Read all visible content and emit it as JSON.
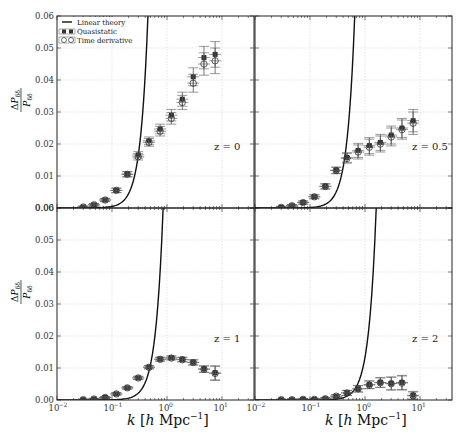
{
  "chart_data": {
    "type": "scatter",
    "layout": "2x2 panels, shared axes",
    "xlabel": "k [h Mpc^-1]",
    "ylabel": "ΔP_δδ / P_δδ",
    "xscale": "log",
    "xlim": [
      0.01,
      40
    ],
    "ylim": [
      0.0,
      0.06
    ],
    "grid": true,
    "x_ticks": [
      "10^-2",
      "10^-1",
      "10^0",
      "10^1"
    ],
    "y_ticks": [
      "0.00",
      "0.01",
      "0.02",
      "0.03",
      "0.04",
      "0.05",
      "0.06"
    ],
    "legend": {
      "position": "upper left of top-left panel",
      "entries": [
        "Linear theory",
        "Quasistatic",
        "Time derivative"
      ]
    },
    "panels": [
      {
        "label": "z = 0",
        "linear_theory_cutoff_k": 0.45,
        "k": [
          0.03,
          0.047,
          0.075,
          0.12,
          0.19,
          0.3,
          0.47,
          0.75,
          1.2,
          1.9,
          3.0,
          4.7,
          7.5
        ],
        "series": [
          {
            "name": "Quasistatic",
            "values": [
              0.0003,
              0.001,
              0.0025,
              0.0055,
              0.0106,
              0.0166,
              0.021,
              0.0247,
              0.029,
              0.034,
              0.041,
              0.047,
              0.048
            ],
            "errors": [
              0.0003,
              0.0004,
              0.0005,
              0.0007,
              0.0008,
              0.001,
              0.0012,
              0.0015,
              0.0018,
              0.0022,
              0.0028,
              0.0035,
              0.004
            ]
          },
          {
            "name": "Time derivative",
            "values": [
              0.0003,
              0.001,
              0.0025,
              0.0055,
              0.0105,
              0.016,
              0.0205,
              0.024,
              0.028,
              0.033,
              0.039,
              0.045,
              0.046
            ],
            "errors": [
              0.0003,
              0.0004,
              0.0005,
              0.0007,
              0.0008,
              0.001,
              0.0012,
              0.0015,
              0.0018,
              0.0022,
              0.0028,
              0.0035,
              0.004
            ]
          }
        ]
      },
      {
        "label": "z = 0.5",
        "linear_theory_cutoff_k": 0.65,
        "k": [
          0.03,
          0.047,
          0.075,
          0.12,
          0.19,
          0.3,
          0.47,
          0.75,
          1.2,
          1.9,
          3.0,
          4.7,
          7.5
        ],
        "series": [
          {
            "name": "Quasistatic",
            "values": [
              0.0002,
              0.0007,
              0.0017,
              0.0035,
              0.0068,
              0.0118,
              0.0158,
              0.018,
              0.0195,
              0.0205,
              0.0228,
              0.025,
              0.0273
            ],
            "errors": [
              0.0003,
              0.0004,
              0.0005,
              0.0006,
              0.0008,
              0.001,
              0.0015,
              0.0022,
              0.0025,
              0.0025,
              0.0028,
              0.003,
              0.0035
            ]
          },
          {
            "name": "Time derivative",
            "values": [
              0.0002,
              0.0007,
              0.0017,
              0.0035,
              0.0067,
              0.0117,
              0.0155,
              0.0175,
              0.019,
              0.02,
              0.0222,
              0.0245,
              0.0265
            ],
            "errors": [
              0.0003,
              0.0004,
              0.0005,
              0.0006,
              0.0008,
              0.001,
              0.0015,
              0.0022,
              0.0025,
              0.0025,
              0.0028,
              0.003,
              0.0035
            ]
          }
        ]
      },
      {
        "label": "z = 1",
        "linear_theory_cutoff_k": 0.85,
        "k": [
          0.03,
          0.047,
          0.075,
          0.12,
          0.19,
          0.3,
          0.47,
          0.75,
          1.2,
          1.9,
          3.0,
          4.7,
          7.5
        ],
        "series": [
          {
            "name": "Quasistatic",
            "values": [
              0.0001,
              0.0003,
              0.0008,
              0.0019,
              0.0038,
              0.0069,
              0.0103,
              0.0128,
              0.0132,
              0.0127,
              0.0118,
              0.0097,
              0.0085
            ],
            "errors": [
              0.0002,
              0.0002,
              0.0003,
              0.0004,
              0.0004,
              0.0005,
              0.0005,
              0.0006,
              0.0006,
              0.0007,
              0.0008,
              0.001,
              0.0022
            ]
          },
          {
            "name": "Time derivative",
            "values": [
              0.0001,
              0.0003,
              0.0008,
              0.0019,
              0.0038,
              0.0069,
              0.0102,
              0.0127,
              0.0131,
              0.0126,
              0.0117,
              0.0096,
              0.0083
            ],
            "errors": [
              0.0002,
              0.0002,
              0.0003,
              0.0004,
              0.0004,
              0.0005,
              0.0005,
              0.0006,
              0.0006,
              0.0007,
              0.0008,
              0.001,
              0.0022
            ]
          }
        ]
      },
      {
        "label": "z = 2",
        "linear_theory_cutoff_k": 1.6,
        "k": [
          0.03,
          0.047,
          0.075,
          0.12,
          0.19,
          0.3,
          0.47,
          0.75,
          1.2,
          1.9,
          3.0,
          4.7,
          7.5
        ],
        "series": [
          {
            "name": "Quasistatic",
            "values": [
              0.0001,
              0.0001,
              0.0002,
              0.0002,
              0.0004,
              0.0012,
              0.0022,
              0.0035,
              0.0048,
              0.0055,
              0.0052,
              0.0055,
              0.0015
            ],
            "errors": [
              0.0002,
              0.0002,
              0.0002,
              0.0003,
              0.0004,
              0.0005,
              0.0008,
              0.001,
              0.0012,
              0.0015,
              0.002,
              0.0022,
              0.0012
            ]
          },
          {
            "name": "Time derivative",
            "values": [
              0.0001,
              0.0001,
              0.0002,
              0.0002,
              0.0004,
              0.0012,
              0.0022,
              0.0035,
              0.0047,
              0.0054,
              0.0051,
              0.0053,
              0.0013
            ],
            "errors": [
              0.0002,
              0.0002,
              0.0002,
              0.0003,
              0.0004,
              0.0005,
              0.0008,
              0.001,
              0.0012,
              0.0015,
              0.002,
              0.0022,
              0.0012
            ]
          }
        ]
      }
    ]
  },
  "labels": {
    "ylabel_num": "ΔP",
    "ylabel_num_sub": "δδ",
    "ylabel_den": "P",
    "ylabel_den_sub": "δδ",
    "xlabel": "k [h Mpc",
    "xlabel_exp": "−1",
    "xlabel_close": "]"
  },
  "colors": {
    "line": "#111111",
    "grid": "#d8d8d8",
    "frame": "#222222",
    "marker_filled": "#333333",
    "errorbar": "#555555"
  }
}
